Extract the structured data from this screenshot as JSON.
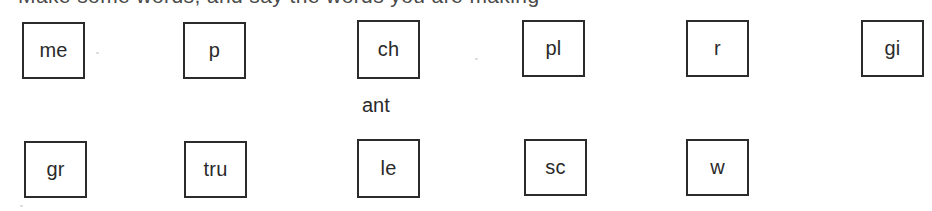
{
  "worksheet": {
    "clipped_heading": "Make some words, and say the words you are making",
    "rows": [
      {
        "row_name": "top-row",
        "boxes": [
          {
            "label": "me",
            "x": 22,
            "y": 22,
            "w": 63,
            "h": 57
          },
          {
            "label": "p",
            "x": 183,
            "y": 22,
            "w": 63,
            "h": 57
          },
          {
            "label": "ch",
            "x": 357,
            "y": 20,
            "w": 63,
            "h": 59
          },
          {
            "label": "pl",
            "x": 522,
            "y": 20,
            "w": 63,
            "h": 57
          },
          {
            "label": "r",
            "x": 686,
            "y": 20,
            "w": 63,
            "h": 57
          },
          {
            "label": "gi",
            "x": 861,
            "y": 20,
            "w": 63,
            "h": 57
          }
        ]
      },
      {
        "row_name": "bottom-row",
        "boxes": [
          {
            "label": "gr",
            "x": 24,
            "y": 141,
            "w": 63,
            "h": 57
          },
          {
            "label": "tru",
            "x": 184,
            "y": 141,
            "w": 63,
            "h": 57
          },
          {
            "label": "le",
            "x": 357,
            "y": 139,
            "w": 63,
            "h": 59
          },
          {
            "label": "sc",
            "x": 524,
            "y": 139,
            "w": 63,
            "h": 57
          },
          {
            "label": "w",
            "x": 686,
            "y": 139,
            "w": 63,
            "h": 57
          }
        ]
      }
    ],
    "loose_words": [
      {
        "text": "ant",
        "x": 362,
        "y": 95
      }
    ]
  },
  "colors": {
    "page_background": "#ffffff",
    "box_border": "#2b2b2b",
    "text": "#2a2a2a",
    "clipped_heading_text": "#4a4a4a"
  }
}
